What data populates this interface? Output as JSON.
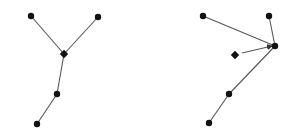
{
  "colors": {
    "background": "#ffffff",
    "node": "#111111",
    "edge": "#555555"
  },
  "diagrams": [
    {
      "name": "left-tree",
      "nodes": [
        {
          "id": "a",
          "x": 31,
          "y": 16,
          "shape": "circle"
        },
        {
          "id": "b",
          "x": 98,
          "y": 17,
          "shape": "circle"
        },
        {
          "id": "j",
          "x": 64,
          "y": 54,
          "shape": "diamond"
        },
        {
          "id": "c",
          "x": 57,
          "y": 94,
          "shape": "circle"
        },
        {
          "id": "d",
          "x": 37,
          "y": 124,
          "shape": "circle"
        }
      ],
      "edges": [
        [
          "a",
          "j"
        ],
        [
          "b",
          "j"
        ],
        [
          "j",
          "c"
        ],
        [
          "c",
          "d"
        ]
      ]
    },
    {
      "name": "right-tree",
      "nodes": [
        {
          "id": "a",
          "x": 203,
          "y": 16,
          "shape": "circle"
        },
        {
          "id": "b",
          "x": 269,
          "y": 16,
          "shape": "circle"
        },
        {
          "id": "j",
          "x": 275,
          "y": 46,
          "shape": "circle"
        },
        {
          "id": "m",
          "x": 235,
          "y": 55,
          "shape": "diamond"
        },
        {
          "id": "c",
          "x": 229,
          "y": 94,
          "shape": "circle"
        },
        {
          "id": "d",
          "x": 209,
          "y": 123,
          "shape": "circle"
        }
      ],
      "edges": [
        [
          "a",
          "j"
        ],
        [
          "b",
          "j"
        ],
        [
          "j",
          "c"
        ],
        [
          "c",
          "d"
        ]
      ],
      "arrows": [
        {
          "from": [
            242,
            53
          ],
          "to": [
            272,
            46
          ]
        }
      ]
    }
  ]
}
